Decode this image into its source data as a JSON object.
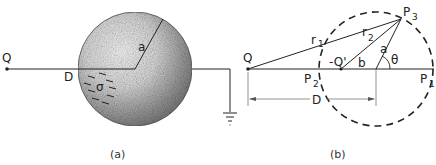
{
  "panel_a": {
    "caption": "(a)",
    "labels": {
      "charge": "Q",
      "distance": "D",
      "radius": "a",
      "surface_charge": "σ"
    }
  },
  "panel_b": {
    "caption": "(b)",
    "labels": {
      "charge": "Q",
      "image_charge": "-Q'",
      "r1": "r",
      "r1_sub": "1",
      "r2": "r",
      "r2_sub": "2",
      "radius": "a",
      "angle": "θ",
      "b": "b",
      "distance": "D",
      "p1": "P",
      "p1_sub": "1",
      "p2": "P",
      "p2_sub": "2",
      "p3": "P",
      "p3_sub": "3"
    }
  },
  "colors": {
    "ink": "#222222",
    "sphere_light": "#f4f4f4",
    "sphere_dark": "#8a8a8a"
  }
}
